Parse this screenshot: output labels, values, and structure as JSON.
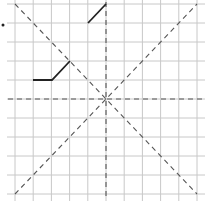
{
  "diagram": {
    "type": "grid-symmetry-exercise",
    "grid": {
      "columns": 10,
      "rows": 10,
      "x0": 15,
      "y0": 4,
      "x1": 197,
      "y1": 194,
      "line_color": "#c8c8c8",
      "extend": 5
    },
    "axes": {
      "center": [
        106,
        99
      ],
      "color": "#555555",
      "dash": "5,4",
      "lines": [
        {
          "name": "horizontal-axis",
          "x1": 8,
          "y1": 99,
          "x2": 204,
          "y2": 99
        },
        {
          "name": "vertical-axis",
          "x1": 106,
          "y1": 2,
          "x2": 106,
          "y2": 200
        },
        {
          "name": "diagonal-down",
          "x1": 15,
          "y1": 4,
          "x2": 197,
          "y2": 194
        },
        {
          "name": "diagonal-up",
          "x1": 15,
          "y1": 194,
          "x2": 197,
          "y2": 4
        }
      ]
    },
    "shapes": [
      {
        "name": "segment-top",
        "points": [
          [
            88,
            23
          ],
          [
            106,
            4
          ]
        ],
        "color": "#222222"
      },
      {
        "name": "segment-left",
        "points": [
          [
            33,
            80
          ],
          [
            52,
            80
          ],
          [
            70,
            61
          ]
        ],
        "color": "#222222"
      }
    ],
    "marker": {
      "name": "dot",
      "cx": 3,
      "cy": 25,
      "r": 1.5,
      "color": "#222222"
    }
  }
}
